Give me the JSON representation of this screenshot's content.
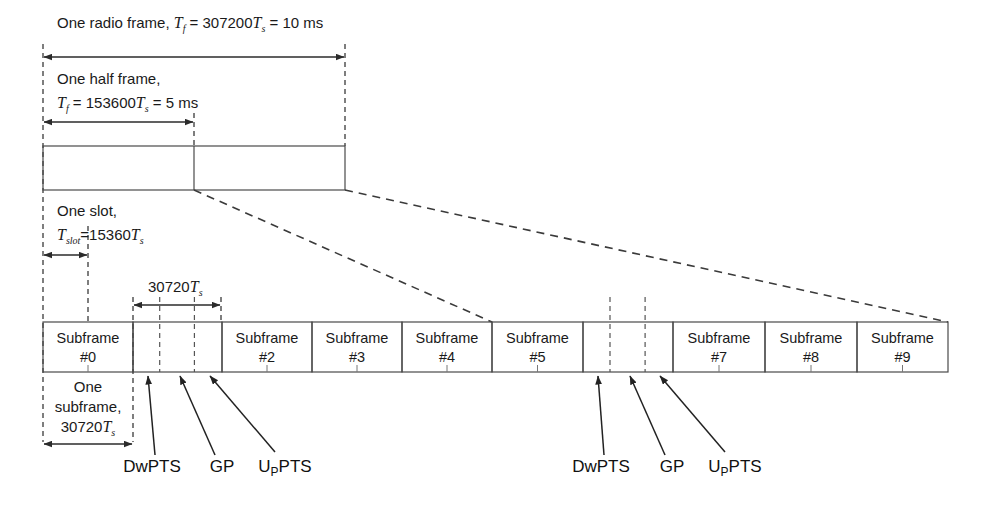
{
  "figure": {
    "colors": {
      "line": "#555555",
      "text": "#1a1a1a",
      "dashed": "#3a3a3a"
    }
  },
  "annotations": {
    "radio_frame": {
      "text_prefix": "One radio frame, ",
      "sym_T": "T",
      "sym_T_sub": "f",
      "eq1": " = 307200",
      "sym_Ts": "T",
      "sym_Ts_sub": "s",
      "eq2": " = 10 ms"
    },
    "half_frame": {
      "line1": "One half frame,",
      "sym_T": "T",
      "sym_T_sub": "f",
      "eq1": " = 153600",
      "sym_Ts": "T",
      "sym_Ts_sub": "s",
      "eq2": " = 5 ms"
    },
    "slot": {
      "line1": "One slot,",
      "sym_T": "T",
      "sym_T_sub": "slot",
      "eq1": "=15360",
      "sym_Ts": "T",
      "sym_Ts_sub": "s"
    },
    "special_subframe": {
      "value": "30720",
      "sym_Ts": "T",
      "sym_Ts_sub": "s"
    },
    "subframe_duration": {
      "line1": "One",
      "line2": "subframe,",
      "value": "30720",
      "sym_Ts": "T",
      "sym_Ts_sub": "s"
    }
  },
  "subframes": [
    {
      "id": "sf0",
      "line1": "Subframe",
      "line2": "#0",
      "x": 43,
      "w": 90,
      "special": false
    },
    {
      "id": "sf1",
      "line1": "",
      "line2": "",
      "x": 133,
      "w": 89,
      "special": true
    },
    {
      "id": "sf2",
      "line1": "Subframe",
      "line2": "#2",
      "x": 222,
      "w": 90,
      "special": false
    },
    {
      "id": "sf3",
      "line1": "Subframe",
      "line2": "#3",
      "x": 312,
      "w": 90,
      "special": false
    },
    {
      "id": "sf4",
      "line1": "Subframe",
      "line2": "#4",
      "x": 402,
      "w": 90,
      "special": false
    },
    {
      "id": "sf5",
      "line1": "Subframe",
      "line2": "#5",
      "x": 492,
      "w": 91,
      "special": false
    },
    {
      "id": "sf6",
      "line1": "",
      "line2": "",
      "x": 583,
      "w": 90,
      "special": true
    },
    {
      "id": "sf7",
      "line1": "Subframe",
      "line2": "#7",
      "x": 673,
      "w": 92,
      "special": false
    },
    {
      "id": "sf8",
      "line1": "Subframe",
      "line2": "#8",
      "x": 765,
      "w": 92,
      "special": false
    },
    {
      "id": "sf9",
      "line1": "Subframe",
      "line2": "#9",
      "x": 857,
      "w": 91,
      "special": false
    }
  ],
  "pts_labels": {
    "left": {
      "dwpts": "DwPTS",
      "gp": "GP",
      "uppts_pre": "U",
      "uppts_sub": "P",
      "uppts_post": "PTS"
    },
    "right": {
      "dwpts": "DwPTS",
      "gp": "GP",
      "uppts_pre": "U",
      "uppts_sub": "P",
      "uppts_post": "PTS"
    }
  }
}
